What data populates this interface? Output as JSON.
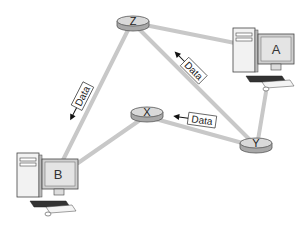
{
  "diagram": {
    "type": "network-routing",
    "colors": {
      "link": "#c8c8c8",
      "router_top": "#d9d9d9",
      "router_side": "#a8a8a8",
      "router_stroke": "#555555",
      "computer_body": "#f2f2f2",
      "computer_stroke": "#444444",
      "screen": "#e4e4e4",
      "arrow": "#111111"
    },
    "nodes": {
      "computer_a": {
        "label": "A",
        "kind": "computer"
      },
      "computer_b": {
        "label": "B",
        "kind": "computer"
      },
      "router_x": {
        "label": "X",
        "kind": "router"
      },
      "router_y": {
        "label": "Y",
        "kind": "router"
      },
      "router_z": {
        "label": "Z",
        "kind": "router"
      }
    },
    "links": [
      {
        "from": "Z",
        "to": "A"
      },
      {
        "from": "Z",
        "to": "Y"
      },
      {
        "from": "Z",
        "to": "B"
      },
      {
        "from": "X",
        "to": "B"
      },
      {
        "from": "X",
        "to": "Y"
      },
      {
        "from": "Y",
        "to": "A"
      }
    ],
    "data_packets": [
      {
        "label": "Data",
        "on_link": "Z-B",
        "direction": "toward B"
      },
      {
        "label": "Data",
        "on_link": "Y-Z",
        "direction": "toward Z"
      },
      {
        "label": "Data",
        "on_link": "Y-X",
        "direction": "toward X"
      }
    ]
  }
}
